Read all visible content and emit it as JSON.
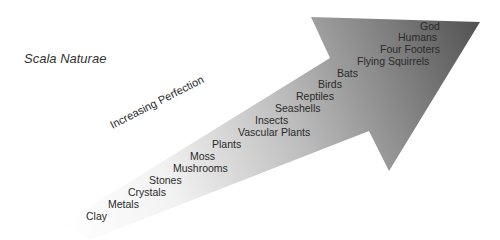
{
  "title": "Scala Naturae",
  "axis_label": "Increasing Perfection",
  "colors": {
    "arrow_dark": "#5a5a5a",
    "arrow_light": "#ffffff",
    "text": "#2a2a2a"
  },
  "levels": [
    "Clay",
    "Metals",
    "Crystals",
    "Stones",
    "Mushrooms",
    "Moss",
    "Plants",
    "Vascular Plants",
    "Insects",
    "Seashells",
    "Reptiles",
    "Birds",
    "Bats",
    "Flying Squirrels",
    "Four Footers",
    "Humans",
    "God"
  ]
}
